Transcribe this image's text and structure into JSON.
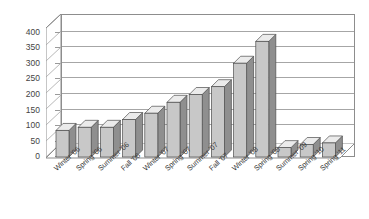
{
  "chart_data": {
    "type": "bar",
    "title": "",
    "subtitle": "",
    "xlabel": "",
    "ylabel": "",
    "ylim": [
      0,
      400
    ],
    "ytick_step": 50,
    "yticks": [
      "400",
      "350",
      "300",
      "250",
      "200",
      "150",
      "100",
      "50",
      "0"
    ],
    "grid": true,
    "legend": false,
    "style": "3d-column",
    "categories": [
      "Winter '06",
      "Spring '06",
      "Summer '06",
      "Fall '06",
      "Winter '07",
      "Spring '07",
      "Summer '07",
      "Fall '07",
      "Winter '08",
      "Spring '08",
      "Summer '09",
      "Spring '10",
      "Spring '11"
    ],
    "values": [
      85,
      95,
      95,
      120,
      140,
      175,
      200,
      225,
      300,
      370,
      30,
      40,
      45
    ],
    "series": [
      {
        "name": "Series 1",
        "values": [
          85,
          95,
          95,
          120,
          140,
          175,
          200,
          225,
          300,
          370,
          30,
          40,
          45
        ]
      }
    ]
  },
  "colors": {
    "bar_front": "#c8c8c8",
    "bar_side": "#8f8f8f",
    "bar_top": "#ebebeb",
    "bar_outline": "#4d4d4d",
    "gridline": "#a6a6a6",
    "axis": "#8d8d8d",
    "wall_fill": "#ffffff",
    "floor_fill": "#ffffff",
    "text": "#3b3b3b"
  }
}
